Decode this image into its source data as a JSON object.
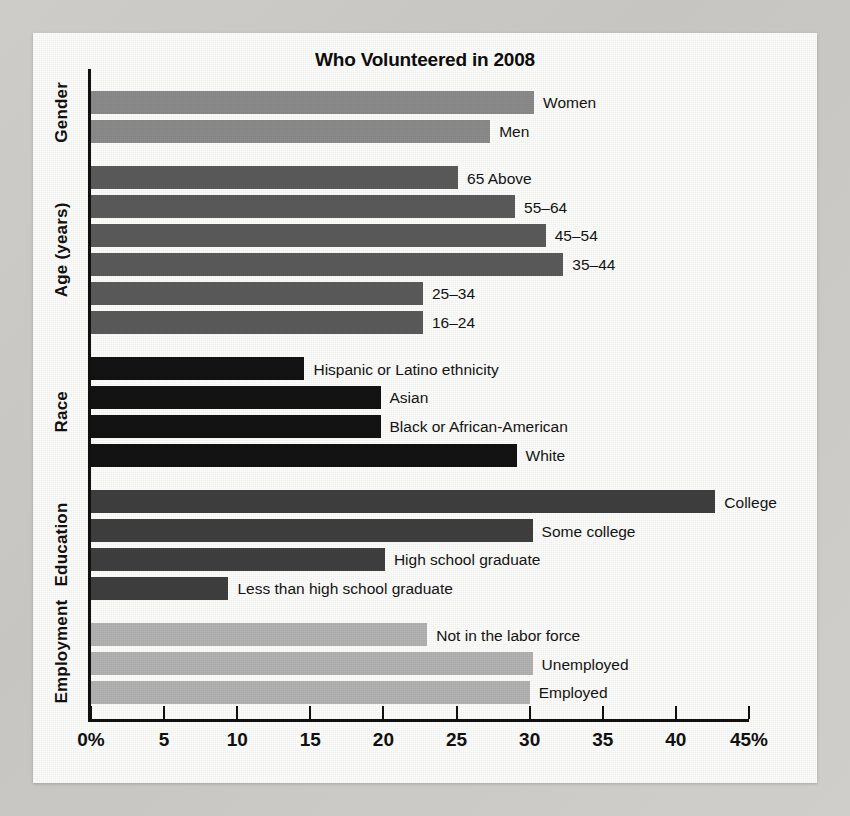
{
  "chart_data": {
    "type": "bar",
    "orientation": "horizontal",
    "title": "Who Volunteered in 2008",
    "xlabel": "",
    "ylabel": "",
    "xlim": [
      0,
      45
    ],
    "grid": false,
    "legend": "none",
    "xticks": [
      0,
      5,
      10,
      15,
      20,
      25,
      30,
      35,
      40,
      45
    ],
    "xticklabels": [
      "0%",
      "5",
      "10",
      "15",
      "20",
      "25",
      "30",
      "35",
      "40",
      "45%"
    ],
    "groups": [
      {
        "name": "Gender",
        "color": "#8b8b8b",
        "categories": [
          "Women",
          "Men"
        ],
        "values": [
          30.3,
          27.3
        ]
      },
      {
        "name": "Age (years)",
        "color": "#5b5b5b",
        "categories": [
          "65 Above",
          "55–64",
          "45–54",
          "35–44",
          "25–34",
          "16–24"
        ],
        "values": [
          25.1,
          29.0,
          31.1,
          32.3,
          22.7,
          22.7
        ]
      },
      {
        "name": "Race",
        "color": "#131313",
        "categories": [
          "Hispanic or Latino ethnicity",
          "Asian",
          "Black or African-American",
          "White"
        ],
        "values": [
          14.6,
          19.8,
          19.8,
          29.1
        ]
      },
      {
        "name": "Education",
        "color": "#3f3f3f",
        "categories": [
          "College",
          "Some college",
          "High school graduate",
          "Less than high school graduate"
        ],
        "values": [
          42.7,
          30.2,
          20.1,
          9.4
        ]
      },
      {
        "name": "Employment",
        "color": "#b3b3b3",
        "categories": [
          "Not in the labor force",
          "Unemployed",
          "Employed"
        ],
        "values": [
          23.0,
          30.2,
          30.0
        ]
      }
    ]
  },
  "figure": {
    "title": "Who Volunteered in 2008"
  }
}
